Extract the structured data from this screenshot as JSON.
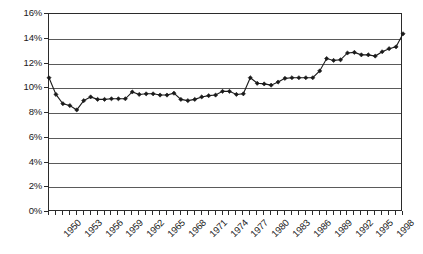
{
  "chart_data": {
    "type": "line",
    "title": "",
    "subtitle": "",
    "xlabel": "",
    "ylabel": "",
    "legend": [],
    "legend_position": "none",
    "grid": true,
    "marker": "diamond",
    "line_color": "#1a1a1a",
    "marker_color": "#1a1a1a",
    "xlim": [
      1950,
      2001
    ],
    "ylim": [
      0,
      16
    ],
    "y_tick_labels": [
      "16%",
      "14%",
      "12%",
      "10%",
      "8%",
      "6%",
      "4%",
      "2%",
      "0%"
    ],
    "y_tick_values": [
      16,
      14,
      12,
      10,
      8,
      6,
      4,
      2,
      0
    ],
    "x_tick_labels": [
      "1950",
      "1953",
      "1956",
      "1959",
      "1962",
      "1965",
      "1968",
      "1971",
      "1974",
      "1977",
      "1980",
      "1983",
      "1986",
      "1989",
      "1992",
      "1995",
      "1998"
    ],
    "x_tick_values": [
      1950,
      1953,
      1956,
      1959,
      1962,
      1965,
      1968,
      1971,
      1974,
      1977,
      1980,
      1983,
      1986,
      1989,
      1992,
      1995,
      1998
    ],
    "x": [
      1950,
      1951,
      1952,
      1953,
      1954,
      1955,
      1956,
      1957,
      1958,
      1959,
      1960,
      1961,
      1962,
      1963,
      1964,
      1965,
      1966,
      1967,
      1968,
      1969,
      1970,
      1971,
      1972,
      1973,
      1974,
      1975,
      1976,
      1977,
      1978,
      1979,
      1980,
      1981,
      1982,
      1983,
      1984,
      1985,
      1986,
      1987,
      1988,
      1989,
      1990,
      1991,
      1992,
      1993,
      1994,
      1995,
      1996,
      1997,
      1998,
      1999,
      2000,
      2001
    ],
    "values": [
      10.85,
      9.5,
      8.75,
      8.6,
      8.25,
      9.0,
      9.3,
      9.1,
      9.1,
      9.15,
      9.15,
      9.15,
      9.7,
      9.5,
      9.55,
      9.55,
      9.45,
      9.45,
      9.6,
      9.1,
      9.0,
      9.1,
      9.3,
      9.4,
      9.45,
      9.75,
      9.75,
      9.5,
      9.55,
      10.85,
      10.4,
      10.35,
      10.25,
      10.5,
      10.8,
      10.85,
      10.85,
      10.85,
      10.85,
      11.4,
      12.4,
      12.25,
      12.3,
      12.85,
      12.9,
      12.7,
      12.7,
      12.6,
      12.95,
      13.2,
      13.35,
      14.4
    ],
    "ticks_minor_x": true
  }
}
